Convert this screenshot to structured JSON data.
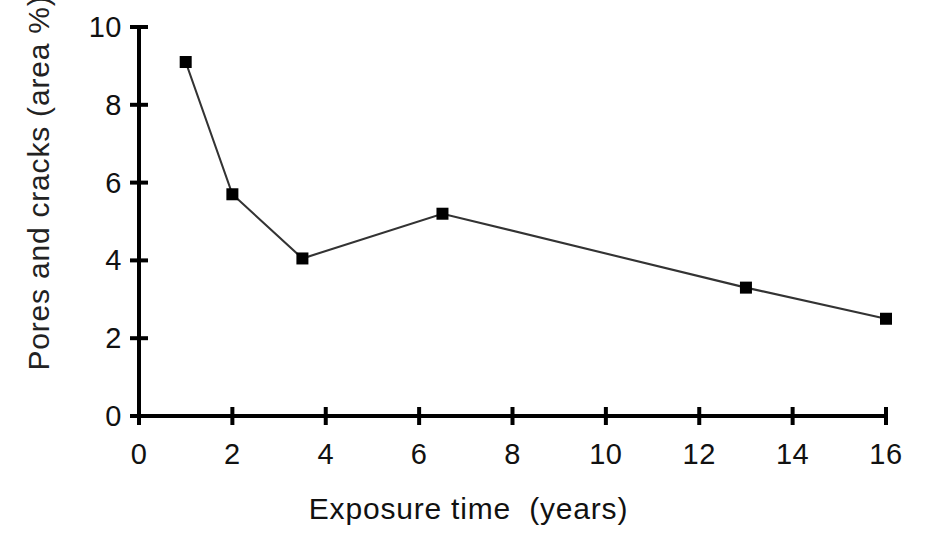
{
  "chart_data": {
    "type": "line",
    "title": "",
    "subtitle": "",
    "xlabel": "Exposure time  (years)",
    "ylabel": "Pores and cracks (area %)",
    "x": [
      1,
      2,
      3.5,
      6.5,
      13,
      16
    ],
    "values": [
      9.1,
      5.7,
      4.05,
      5.2,
      3.3,
      2.5
    ],
    "series": [
      {
        "name": "Pores and cracks",
        "x": [
          1,
          2,
          3.5,
          6.5,
          13,
          16
        ],
        "values": [
          9.1,
          5.7,
          4.05,
          5.2,
          3.3,
          2.5
        ],
        "marker": "filled-square",
        "marker_color": "#000000",
        "line_color": "#333333"
      }
    ],
    "xlim": [
      0,
      16
    ],
    "ylim": [
      0,
      10
    ],
    "x_ticks": [
      0,
      2,
      4,
      6,
      8,
      10,
      12,
      14,
      16
    ],
    "y_ticks": [
      0,
      2,
      4,
      6,
      8,
      10
    ],
    "x_tick_labels": [
      "0",
      "2",
      "4",
      "6",
      "8",
      "10",
      "12",
      "14",
      "16"
    ],
    "y_tick_labels": [
      "0",
      "2",
      "4",
      "6",
      "8",
      "10"
    ],
    "grid": false,
    "legend": false,
    "legend_position": "none",
    "background_color": "#ffffff",
    "axis_color": "#000000"
  },
  "axes": {
    "x_title": "Exposure time  (years)",
    "y_title": "Pores and cracks (area %)",
    "x_tick_labels": [
      "0",
      "2",
      "4",
      "6",
      "8",
      "10",
      "12",
      "14",
      "16"
    ],
    "y_tick_labels": [
      "0",
      "2",
      "4",
      "6",
      "8",
      "10"
    ]
  }
}
